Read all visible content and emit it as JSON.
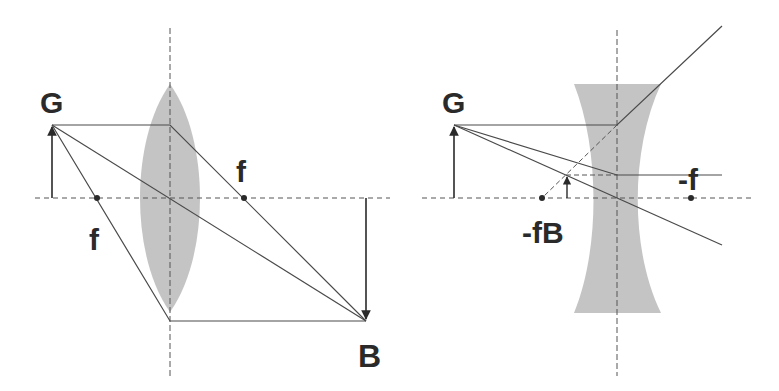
{
  "colors": {
    "line": "#4a4a4a",
    "lens": "#c4c4c4",
    "text": "#2a2a2a",
    "background": "#ffffff"
  },
  "converging": {
    "title": "Converging lens",
    "object_label": "G",
    "image_label": "B",
    "focal_left_label": "f",
    "focal_right_label": "f"
  },
  "diverging": {
    "title": "Diverging lens",
    "object_label": "G",
    "focal_right_label": "-f",
    "image_focal_label": "-fB"
  }
}
